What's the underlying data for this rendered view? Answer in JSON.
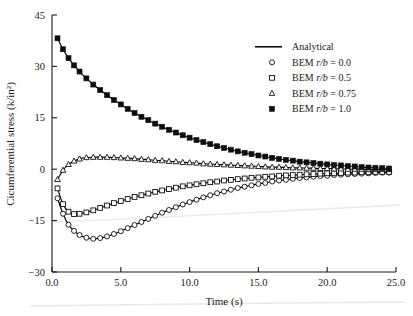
{
  "chart_data": {
    "type": "line",
    "title": "",
    "xlabel": "Time (s)",
    "ylabel": "Cicumferential stress (k/in²)",
    "xlim": [
      0.0,
      25.0
    ],
    "ylim": [
      -30,
      45
    ],
    "xticks": [
      0.0,
      5.0,
      10.0,
      15.0,
      20.0,
      25.0
    ],
    "xtick_labels": [
      "0.0",
      "5.0",
      "10.0",
      "15.0",
      "20.0",
      "25.0"
    ],
    "yticks": [
      -30,
      -15,
      0,
      15,
      30,
      45
    ],
    "ytick_labels": [
      "−30",
      "−15",
      "0",
      "15",
      "30",
      "45"
    ],
    "grid": false,
    "legend_position": "upper right",
    "legend_frame": false,
    "series": [
      {
        "name": "Analytical",
        "marker": "none",
        "style": "solid-line",
        "note": "Analytical solution drawn as continuous solid line underlying every BEM series"
      },
      {
        "name": "BEM r/b = 0.0",
        "marker": "open-circle",
        "x": [
          0.4,
          0.8,
          1.2,
          1.6,
          2.0,
          2.5,
          3.0,
          3.5,
          4.0,
          4.5,
          5.0,
          5.5,
          6.0,
          6.5,
          7.0,
          7.5,
          8.0,
          8.5,
          9.0,
          9.5,
          10.0,
          10.5,
          11.0,
          11.5,
          12.0,
          12.5,
          13.0,
          13.5,
          14.0,
          14.5,
          15.0,
          15.5,
          16.0,
          16.5,
          17.0,
          17.5,
          18.0,
          18.5,
          19.0,
          19.5,
          20.0,
          20.5,
          21.0,
          21.5,
          22.0,
          22.5,
          23.0,
          23.5,
          24.0,
          24.5
        ],
        "y": [
          -8.5,
          -13.0,
          -16.2,
          -18.0,
          -19.2,
          -20.0,
          -20.3,
          -20.1,
          -19.6,
          -18.9,
          -18.1,
          -17.2,
          -16.3,
          -15.4,
          -14.5,
          -13.6,
          -12.7,
          -11.9,
          -11.1,
          -10.3,
          -9.6,
          -8.9,
          -8.2,
          -7.6,
          -7.0,
          -6.5,
          -6.0,
          -5.5,
          -5.1,
          -4.7,
          -4.3,
          -4.0,
          -3.6,
          -3.3,
          -3.1,
          -2.8,
          -2.6,
          -2.4,
          -2.2,
          -2.0,
          -1.9,
          -1.7,
          -1.6,
          -1.5,
          -1.4,
          -1.3,
          -1.2,
          -1.1,
          -1.0,
          -1.0
        ]
      },
      {
        "name": "BEM r/b = 0.5",
        "marker": "open-square",
        "x": [
          0.4,
          0.8,
          1.2,
          1.6,
          2.0,
          2.5,
          3.0,
          3.5,
          4.0,
          4.5,
          5.0,
          5.5,
          6.0,
          6.5,
          7.0,
          7.5,
          8.0,
          8.5,
          9.0,
          9.5,
          10.0,
          10.5,
          11.0,
          11.5,
          12.0,
          12.5,
          13.0,
          13.5,
          14.0,
          14.5,
          15.0,
          15.5,
          16.0,
          16.5,
          17.0,
          17.5,
          18.0,
          18.5,
          19.0,
          19.5,
          20.0,
          20.5,
          21.0,
          21.5,
          22.0,
          22.5,
          23.0,
          23.5,
          24.0,
          24.5
        ],
        "y": [
          -5.6,
          -10.2,
          -12.4,
          -13.1,
          -13.0,
          -12.6,
          -12.0,
          -11.3,
          -10.6,
          -9.9,
          -9.3,
          -8.7,
          -8.1,
          -7.6,
          -7.1,
          -6.6,
          -6.2,
          -5.8,
          -5.4,
          -5.0,
          -4.7,
          -4.4,
          -4.1,
          -3.8,
          -3.6,
          -3.3,
          -3.1,
          -2.9,
          -2.7,
          -2.5,
          -2.4,
          -2.2,
          -2.1,
          -1.9,
          -1.8,
          -1.7,
          -1.6,
          -1.5,
          -1.4,
          -1.3,
          -1.2,
          -1.2,
          -1.1,
          -1.0,
          -1.0,
          -0.9,
          -0.9,
          -0.8,
          -0.8,
          -0.8
        ]
      },
      {
        "name": "BEM r/b = 0.75",
        "marker": "open-triangle",
        "x": [
          0.4,
          0.8,
          1.2,
          1.6,
          2.0,
          2.5,
          3.0,
          3.5,
          4.0,
          4.5,
          5.0,
          5.5,
          6.0,
          6.5,
          7.0,
          7.5,
          8.0,
          8.5,
          9.0,
          9.5,
          10.0,
          10.5,
          11.0,
          11.5,
          12.0,
          12.5,
          13.0,
          13.5,
          14.0,
          14.5,
          15.0,
          15.5,
          16.0,
          16.5,
          17.0,
          17.5,
          18.0,
          18.5,
          19.0,
          19.5,
          20.0,
          20.5,
          21.0,
          21.5,
          22.0,
          22.5,
          23.0,
          23.5,
          24.0,
          24.5
        ],
        "y": [
          -3.0,
          -0.3,
          1.4,
          2.4,
          3.0,
          3.4,
          3.5,
          3.5,
          3.5,
          3.4,
          3.3,
          3.2,
          3.1,
          2.9,
          2.8,
          2.6,
          2.5,
          2.3,
          2.2,
          2.0,
          1.9,
          1.8,
          1.6,
          1.5,
          1.4,
          1.3,
          1.2,
          1.1,
          1.0,
          0.9,
          0.8,
          0.7,
          0.6,
          0.6,
          0.5,
          0.4,
          0.4,
          0.3,
          0.3,
          0.2,
          0.2,
          0.1,
          0.1,
          0.0,
          0.0,
          0.0,
          -0.1,
          -0.1,
          -0.1,
          -0.1
        ]
      },
      {
        "name": "BEM r/b = 1.0",
        "marker": "filled-square",
        "x": [
          0.4,
          0.8,
          1.2,
          1.6,
          2.0,
          2.5,
          3.0,
          3.5,
          4.0,
          4.5,
          5.0,
          5.5,
          6.0,
          6.5,
          7.0,
          7.5,
          8.0,
          8.5,
          9.0,
          9.5,
          10.0,
          10.5,
          11.0,
          11.5,
          12.0,
          12.5,
          13.0,
          13.5,
          14.0,
          14.5,
          15.0,
          15.5,
          16.0,
          16.5,
          17.0,
          17.5,
          18.0,
          18.5,
          19.0,
          19.5,
          20.0,
          20.5,
          21.0,
          21.5,
          22.0,
          22.5,
          23.0,
          23.5,
          24.0,
          24.5
        ],
        "y": [
          38.2,
          35.0,
          32.4,
          30.3,
          28.5,
          26.5,
          24.7,
          23.1,
          21.6,
          20.2,
          18.9,
          17.6,
          16.4,
          15.3,
          14.3,
          13.3,
          12.4,
          11.5,
          10.7,
          9.9,
          9.2,
          8.5,
          7.9,
          7.3,
          6.7,
          6.2,
          5.7,
          5.2,
          4.8,
          4.4,
          4.0,
          3.7,
          3.3,
          3.0,
          2.7,
          2.5,
          2.2,
          2.0,
          1.8,
          1.6,
          1.4,
          1.2,
          1.1,
          0.9,
          0.8,
          0.6,
          0.5,
          0.4,
          0.3,
          0.2
        ]
      }
    ]
  },
  "legend": {
    "entries": [
      {
        "label": "Analytical",
        "marker": "line"
      },
      {
        "label_prefix": "BEM ",
        "label_ital": "r/b",
        "label_suffix": " = 0.0",
        "marker": "open-circle"
      },
      {
        "label_prefix": "BEM ",
        "label_ital": "r/b",
        "label_suffix": " = 0.5",
        "marker": "open-square"
      },
      {
        "label_prefix": "BEM ",
        "label_ital": "r/b",
        "label_suffix": " = 0.75",
        "marker": "open-triangle"
      },
      {
        "label_prefix": "BEM ",
        "label_ital": "r/b",
        "label_suffix": " = 1.0",
        "marker": "filled-square"
      }
    ]
  },
  "colors": {
    "ink": "#1a1a1a",
    "curve": "#000000",
    "background": "#ffffff",
    "marker_fill_open": "#ffffff",
    "marker_fill_solid": "#0d0d0d"
  }
}
